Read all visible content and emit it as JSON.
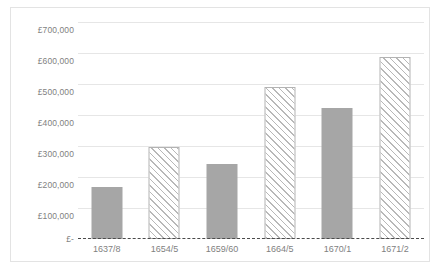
{
  "chart_data": {
    "type": "bar",
    "title": "",
    "subtitle": "",
    "xlabel": "",
    "ylabel": "",
    "categories": [
      "1637/8",
      "1654/5",
      "1659/60",
      "1664/5",
      "1670/1",
      "1671/2"
    ],
    "values": [
      168000,
      296000,
      242000,
      489000,
      424000,
      586000
    ],
    "series": [
      {
        "name": "",
        "values": [
          168000,
          296000,
          242000,
          489000,
          424000,
          586000
        ],
        "fills": [
          "solid",
          "hatched",
          "solid",
          "hatched",
          "solid",
          "hatched"
        ]
      }
    ],
    "ylim": [
      0,
      700000
    ],
    "ytick_values": [
      700000,
      600000,
      500000,
      400000,
      300000,
      200000,
      100000,
      0
    ],
    "ytick_labels": [
      "£700,000",
      "£600,000",
      "£500,000",
      "£400,000",
      "£300,000",
      "£200,000",
      "£100,000",
      "£-"
    ],
    "grid": true,
    "grid_axis": "y",
    "legend": false,
    "legend_position": "none",
    "currency_symbol": "£",
    "zero_line_style": "dashed",
    "colors": {
      "bar_solid": "#a6a6a6",
      "bar_hatch_stroke": "#b8b8b8",
      "bar_hatch_background": "#ffffff",
      "gridline": "#e6e6e6",
      "zero_axis": "#4a4a4a",
      "tick_label": "#7f7f7f",
      "frame_border": "#e3e3e3",
      "plot_background": "#ffffff"
    }
  }
}
